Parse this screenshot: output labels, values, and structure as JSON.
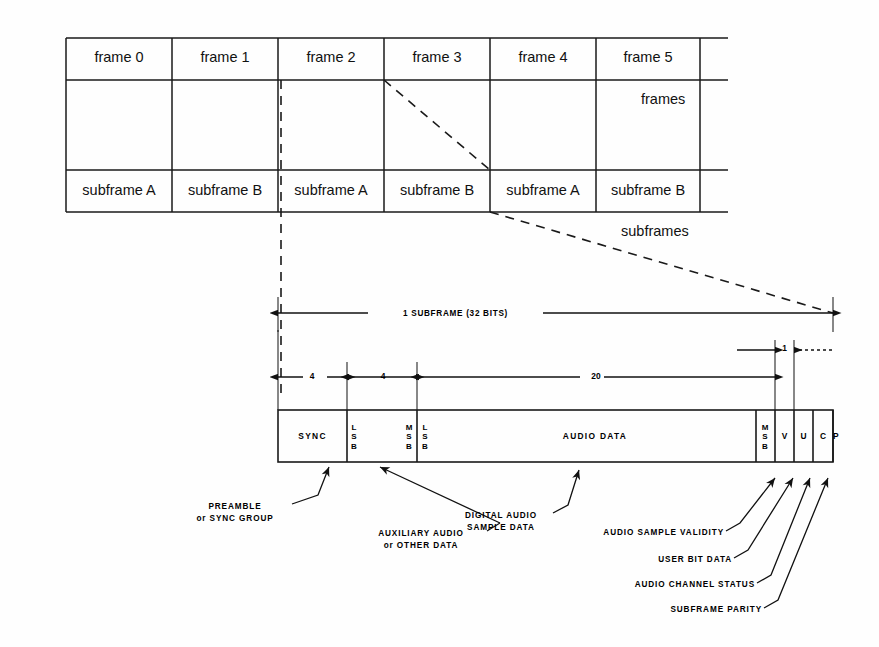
{
  "figure": {
    "line_color": "#1a1a1a",
    "background": "#fefefe"
  },
  "frames_row": {
    "label": "frames",
    "cells": [
      {
        "label": "frame 0"
      },
      {
        "label": "frame 1"
      },
      {
        "label": "frame 2"
      },
      {
        "label": "frame 3"
      },
      {
        "label": "frame 4"
      },
      {
        "label": "frame 5"
      }
    ]
  },
  "subframes_row": {
    "label": "subframes",
    "cells": [
      {
        "label": "subframe A"
      },
      {
        "label": "subframe B"
      },
      {
        "label": "subframe A"
      },
      {
        "label": "subframe B"
      },
      {
        "label": "subframe A"
      },
      {
        "label": "subframe B"
      }
    ]
  },
  "dimensions": {
    "total": "1   SUBFRAME  (32 BITS)",
    "sync_bits": "4",
    "aux_bits": "4",
    "audio_bits": "20",
    "single_bit": "1"
  },
  "subframe_bar": {
    "fields": [
      {
        "name": "sync",
        "label": "SYNC",
        "lsb": "",
        "msb": ""
      },
      {
        "name": "aux-audio",
        "label": "",
        "lsb": "L\nS\nB",
        "msb": "M\nS\nB"
      },
      {
        "name": "audio-data",
        "label": "AUDIO DATA",
        "lsb": "L\nS\nB",
        "msb": "M\nS\nB"
      },
      {
        "name": "validity",
        "label": "V"
      },
      {
        "name": "user",
        "label": "U"
      },
      {
        "name": "channel-status",
        "label": "C"
      },
      {
        "name": "parity",
        "label": "P"
      }
    ]
  },
  "callouts": {
    "preamble": {
      "line1": "PREAMBLE",
      "line2": "or SYNC GROUP"
    },
    "auxiliary": {
      "line1": "AUXILIARY AUDIO",
      "line2": "or OTHER DATA"
    },
    "digital_audio": {
      "line1": "DIGITAL AUDIO",
      "line2": "SAMPLE DATA"
    },
    "validity": {
      "text": "AUDIO SAMPLE VALIDITY"
    },
    "user_bit": {
      "text": "USER BIT DATA"
    },
    "channel_status": {
      "text": "AUDIO CHANNEL STATUS"
    },
    "parity": {
      "text": "SUBFRAME PARITY"
    }
  }
}
